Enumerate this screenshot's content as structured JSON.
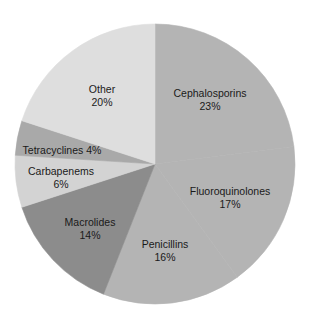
{
  "chart_data": {
    "type": "pie",
    "title": "",
    "start_angle_deg": 0,
    "direction": "clockwise",
    "slices": [
      {
        "label": "Cephalosporins",
        "value": 23,
        "value_text": "23%",
        "color": "#b4b4b4"
      },
      {
        "label": "Fluoroquinolones",
        "value": 17,
        "value_text": "17%",
        "color": "#b4b4b4"
      },
      {
        "label": "Penicillins",
        "value": 16,
        "value_text": "16%",
        "color": "#b4b4b4"
      },
      {
        "label": "Macrolides",
        "value": 14,
        "value_text": "14%",
        "color": "#8c8c8c"
      },
      {
        "label": "Carbapenems",
        "value": 6,
        "value_text": "6%",
        "color": "#d3d3d3"
      },
      {
        "label": "Tetracyclines",
        "value": 4,
        "value_text": "4%",
        "color": "#a9a9a9"
      },
      {
        "label": "Other",
        "value": 20,
        "value_text": "20%",
        "color": "#dedede"
      }
    ],
    "legend": "none (labels placed directly on slices)"
  },
  "labels": {
    "cephalosporins": {
      "name": "Cephalosporins",
      "pct": "23%"
    },
    "fluoroquinolones": {
      "name": "Fluoroquinolones",
      "pct": "17%"
    },
    "penicillins": {
      "name": "Penicillins",
      "pct": "16%"
    },
    "macrolides": {
      "name": "Macrolides",
      "pct": "14%"
    },
    "carbapenems": {
      "name": "Carbapenems",
      "pct": "6%"
    },
    "tetracyclines": {
      "text": "Tetracyclines 4%"
    },
    "other": {
      "name": "Other",
      "pct": "20%"
    }
  }
}
